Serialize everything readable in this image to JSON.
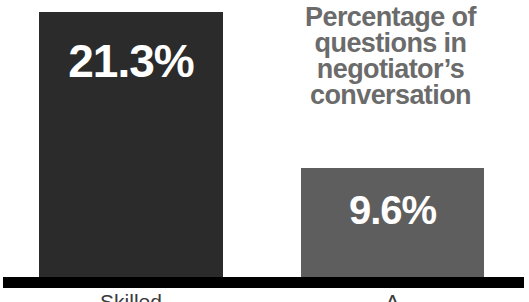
{
  "chart_data": {
    "type": "bar",
    "title_lines": [
      "Percentage of",
      "questions in",
      "negotiator’s",
      "conversation"
    ],
    "categories": [
      "Skilled",
      "A"
    ],
    "values": [
      21.3,
      9.6
    ],
    "value_labels": [
      "21.3%",
      "9.6%"
    ],
    "xlabel": "",
    "ylabel": "",
    "ylim": [
      0,
      22.5
    ],
    "grid": false,
    "legend": "none",
    "orientation": "vertical",
    "series": [
      {
        "name": "Percentage of questions in negotiator's conversation",
        "values": [
          21.3,
          9.6
        ]
      }
    ],
    "bars": [
      {
        "category": "Skilled",
        "value": 21.3,
        "value_label": "21.3%",
        "color": "#2b2b2b"
      },
      {
        "category": "A",
        "value": 9.6,
        "value_label": "9.6%",
        "color": "#5e5e5e"
      }
    ],
    "colors": {
      "background": "#ffffff",
      "bar_dark": "#2b2b2b",
      "bar_grey": "#5e5e5e",
      "value_text": "#ffffff",
      "title_text": "#6b6b6b",
      "baseline": "#000000",
      "category_text": "#3a3a3a"
    }
  }
}
